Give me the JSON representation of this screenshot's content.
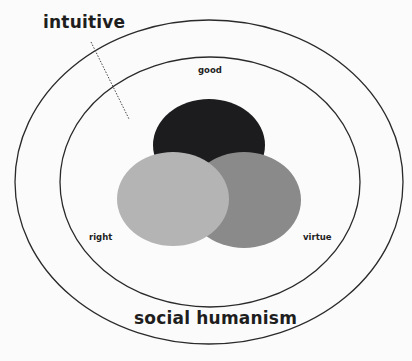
{
  "diagram": {
    "outer_ring": {
      "label": "social humanism"
    },
    "pointer_label": "intuitive",
    "inner_ring": {},
    "circles": [
      {
        "label": "good",
        "color": "#1c1c1e"
      },
      {
        "label": "right",
        "color": "#b4b4b4"
      },
      {
        "label": "virtue",
        "color": "#8a8a8a"
      }
    ],
    "colors": {
      "background": "#fbfbfb",
      "ring_stroke": "#2a2a2a",
      "text": "#1e1e1e"
    }
  }
}
